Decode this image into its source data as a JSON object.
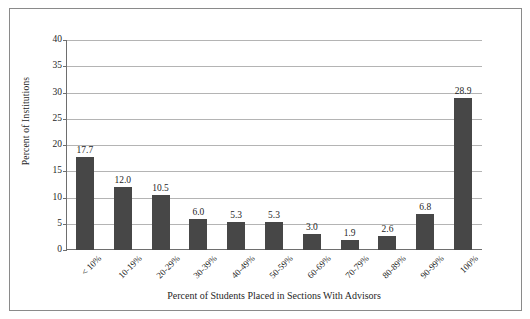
{
  "chart_data": {
    "type": "bar",
    "title": "",
    "xlabel": "Percent of Students Placed in Sections With Advisors",
    "ylabel": "Percent of Institutions",
    "categories": [
      "< 10%",
      "10-19%",
      "20-29%",
      "30-39%",
      "40-49%",
      "50-59%",
      "60-69%",
      "70-79%",
      "80-89%",
      "90-99%",
      "100%"
    ],
    "values": [
      17.7,
      12.0,
      10.5,
      6.0,
      5.3,
      5.3,
      3.0,
      1.9,
      2.6,
      6.8,
      28.9
    ],
    "value_labels": [
      "17.7",
      "12.0",
      "10.5",
      "6.0",
      "5.3",
      "5.3",
      "3.0",
      "1.9",
      "2.6",
      "6.8",
      "28.9"
    ],
    "ylim": [
      0,
      40
    ],
    "ytick_values": [
      0,
      5,
      10,
      15,
      20,
      25,
      30,
      35,
      40
    ],
    "ytick_labels": [
      "0",
      "5",
      "10",
      "15",
      "20",
      "25",
      "30",
      "35",
      "40"
    ],
    "grid": true,
    "legend": false,
    "bar_color": "#474747",
    "gridline_color": "#b4b4b4",
    "axis_color": "#6e6e6e",
    "frame_color": "#8a8a8a",
    "background_color": "#ffffff"
  }
}
